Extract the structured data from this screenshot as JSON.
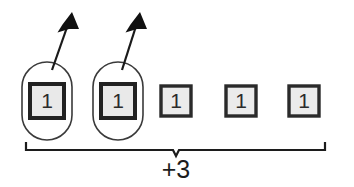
{
  "diagram": {
    "type": "math-manipulative-number-bond",
    "background_color": "#ffffff",
    "tiles": [
      {
        "label": "1",
        "x": 28,
        "y": 82,
        "size": 38,
        "border_width": 4,
        "fill_color": "#e9e9e9",
        "border_color": "#222222",
        "circled": true
      },
      {
        "label": "1",
        "x": 99,
        "y": 82,
        "size": 38,
        "border_width": 4,
        "fill_color": "#e9e9e9",
        "border_color": "#222222",
        "circled": true
      },
      {
        "label": "1",
        "x": 160,
        "y": 85,
        "size": 32,
        "border_width": 3,
        "fill_color": "#ebebeb",
        "border_color": "#2a2a2a",
        "circled": false
      },
      {
        "label": "1",
        "x": 225,
        "y": 85,
        "size": 32,
        "border_width": 3,
        "fill_color": "#ebebeb",
        "border_color": "#2a2a2a",
        "circled": false
      },
      {
        "label": "1",
        "x": 288,
        "y": 85,
        "size": 32,
        "border_width": 3,
        "fill_color": "#ebebeb",
        "border_color": "#2a2a2a",
        "circled": false
      }
    ],
    "circles": [
      {
        "x": 22,
        "y": 62,
        "width": 50,
        "height": 78,
        "stroke_color": "#3a3a3a"
      },
      {
        "x": 93,
        "y": 62,
        "width": 50,
        "height": 78,
        "stroke_color": "#3a3a3a"
      }
    ],
    "arrows": [
      {
        "tail_x": 52,
        "tail_y": 70,
        "tip_x": 72,
        "tip_y": 14,
        "stroke_color": "#1a1a1a"
      },
      {
        "tail_x": 122,
        "tail_y": 70,
        "tip_x": 140,
        "tip_y": 14,
        "stroke_color": "#1a1a1a"
      }
    ],
    "brace": {
      "left_x": 26,
      "right_x": 325,
      "y": 150,
      "tick_height": 8,
      "notch_depth": 6,
      "stroke_color": "#1c1c1c",
      "label": "+3",
      "label_x": 176,
      "label_y": 170
    }
  }
}
